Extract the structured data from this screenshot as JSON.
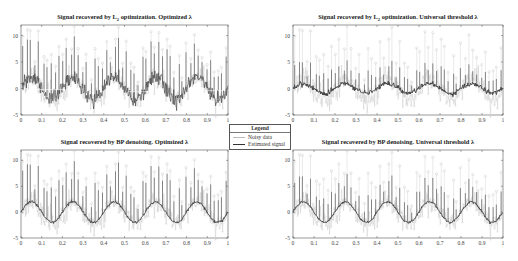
{
  "legend": {
    "title": "Legend",
    "items": [
      {
        "label": "Noisy data",
        "color": "#bbbbbb"
      },
      {
        "label": "Estimated signal",
        "color": "#333333"
      }
    ]
  },
  "chart_data": [
    {
      "type": "line",
      "title": "Signal recovered by L2 optimization. Optimized λ",
      "title_parts": [
        "Signal recovered by L",
        "2",
        " optimization. Optimized λ"
      ],
      "xlabel": "",
      "ylabel": "",
      "xlim": [
        0,
        1
      ],
      "ylim": [
        -5,
        12
      ],
      "xticks": [
        "0",
        "0.1",
        "0.2",
        "0.3",
        "0.4",
        "0.5",
        "0.6",
        "0.7",
        "0.8",
        "0.9",
        "1"
      ],
      "yticks": [
        "-5",
        "0",
        "5",
        "10"
      ],
      "grid": false,
      "series": [
        {
          "name": "Noisy data",
          "description": "sinusoid (amplitude ~2, 5 periods) + gaussian noise + impulsive spikes up to ~10"
        },
        {
          "name": "Estimated signal",
          "description": "noisy estimate following sinusoid with spikes retained"
        }
      ],
      "estimate_style": "noisy"
    },
    {
      "type": "line",
      "title": "Signal recovered by L2 optimization. Universal threshold λ",
      "title_parts": [
        "Signal recovered by L",
        "2",
        " optimization. Universal threshold λ"
      ],
      "xlabel": "",
      "ylabel": "",
      "xlim": [
        0,
        1
      ],
      "ylim": [
        -5,
        12
      ],
      "xticks": [
        "0",
        "0.1",
        "0.2",
        "0.3",
        "0.4",
        "0.5",
        "0.6",
        "0.7",
        "0.8",
        "0.9",
        "1"
      ],
      "yticks": [
        "-5",
        "0",
        "5",
        "10"
      ],
      "grid": false,
      "series": [
        {
          "name": "Noisy data"
        },
        {
          "name": "Estimated signal",
          "description": "over-smoothed, amplitude ~1"
        }
      ],
      "estimate_style": "shrunk"
    },
    {
      "type": "line",
      "title": "Signal recovered by BP denoising. Optimized λ",
      "title_parts": [
        "Signal recovered by BP denoising. Optimized λ"
      ],
      "xlabel": "",
      "ylabel": "",
      "xlim": [
        0,
        1
      ],
      "ylim": [
        -5,
        12
      ],
      "xticks": [
        "0",
        "0.1",
        "0.2",
        "0.3",
        "0.4",
        "0.5",
        "0.6",
        "0.7",
        "0.8",
        "0.9",
        "1"
      ],
      "yticks": [
        "-5",
        "0",
        "5",
        "10"
      ],
      "grid": false,
      "series": [
        {
          "name": "Noisy data"
        },
        {
          "name": "Estimated signal",
          "description": "smooth sinusoid with spikes recovered"
        }
      ],
      "estimate_style": "clean"
    },
    {
      "type": "line",
      "title": "Signal recovered by BP denoising. Universal threshold λ",
      "title_parts": [
        "Signal recovered by BP denoising. Universal threshold λ"
      ],
      "xlabel": "",
      "ylabel": "",
      "xlim": [
        0,
        1
      ],
      "ylim": [
        -5,
        12
      ],
      "xticks": [
        "0",
        "0.1",
        "0.2",
        "0.3",
        "0.4",
        "0.5",
        "0.6",
        "0.7",
        "0.8",
        "0.9",
        "1"
      ],
      "yticks": [
        "-5",
        "0",
        "5",
        "10"
      ],
      "grid": false,
      "series": [
        {
          "name": "Noisy data"
        },
        {
          "name": "Estimated signal",
          "description": "smooth sinusoid with spikes partially recovered"
        }
      ],
      "estimate_style": "clean"
    }
  ],
  "signal_model": {
    "sine_amplitude": 2,
    "sine_cycles": 5,
    "noise_sigma": 0.9,
    "spike_count": 52,
    "spike_height_range": [
      3,
      10
    ]
  }
}
